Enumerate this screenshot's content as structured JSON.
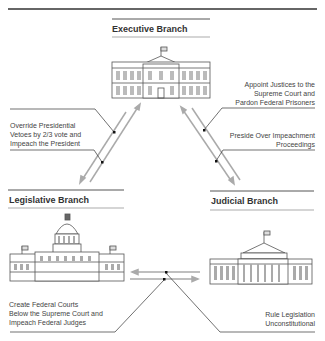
{
  "diagram": {
    "branches": {
      "executive": {
        "title": "Executive Branch"
      },
      "legislative": {
        "title": "Legislative Branch"
      },
      "judicial": {
        "title": "Judicial Branch"
      }
    },
    "checks": {
      "executive_to_judicial": "Appoint Justices to the\nSupreme Court and\nPardon Federal Prisoners",
      "legislative_to_executive": "Override Presidential\nVetoes by 2/3 vote and\nImpeach the President",
      "judicial_to_executive": "Preside Over Impeachment\nProceedings",
      "legislative_to_judicial": "Create Federal Courts\nBelow the Supreme Court and\nImpeach Federal Judges",
      "judicial_to_legislative": "Rule Legislation\nUnconstitutional"
    },
    "colors": {
      "line": "#333333",
      "arrow": "#aaaaaa"
    }
  }
}
